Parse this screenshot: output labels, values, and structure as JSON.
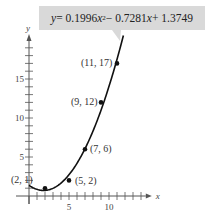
{
  "chart_data": {
    "type": "scatter",
    "title": "",
    "annotation": "y = 0.1996x² − 0.7281x + 1.3749",
    "equation": {
      "a": 0.1996,
      "b": -0.7281,
      "c": 1.3749
    },
    "xlabel": "x",
    "ylabel": "y",
    "xlim": [
      0,
      15
    ],
    "ylim": [
      0,
      20
    ],
    "xticks": [
      5,
      10
    ],
    "yticks": [
      5,
      10,
      15
    ],
    "grid": false,
    "legend": null,
    "points": [
      {
        "x": 2,
        "y": 1,
        "label": "(2, 1)"
      },
      {
        "x": 5,
        "y": 2,
        "label": "(5, 2)"
      },
      {
        "x": 7,
        "y": 6,
        "label": "(7, 6)"
      },
      {
        "x": 9,
        "y": 12,
        "label": "(9, 12)"
      },
      {
        "x": 11,
        "y": 17,
        "label": "(11, 17)"
      }
    ],
    "curve": {
      "type": "quadratic fit",
      "x_range": [
        0,
        11.8
      ]
    }
  },
  "callout": {
    "prefix": "y",
    "text_a": " = 0.1996",
    "var1": "x",
    "sup": "2",
    "text_b": " − 0.7281",
    "var2": "x",
    "text_c": " + 1.3749"
  },
  "axes": {
    "x_label": "x",
    "y_label": "y",
    "x_tick_5": "5",
    "x_tick_10": "10",
    "y_tick_5": "5",
    "y_tick_10": "10",
    "y_tick_15": "15"
  },
  "style": {
    "curve_color": "#111111",
    "axis_color": "#555555",
    "callout_bg": "#d9d9d9"
  }
}
